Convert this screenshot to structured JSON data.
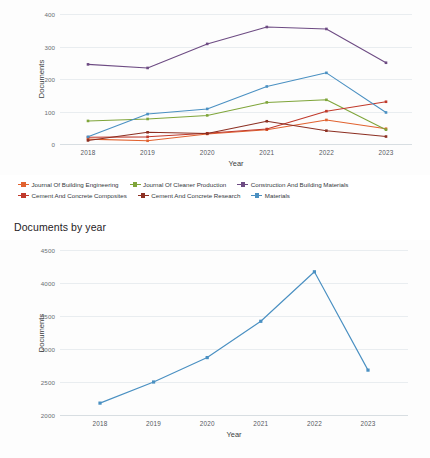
{
  "section": {
    "title": "Documents by year"
  },
  "chart_data": [
    {
      "type": "line",
      "name": "documents-per-source-by-year",
      "title": "",
      "xlabel": "Year",
      "ylabel": "Documents",
      "categories": [
        "2018",
        "2019",
        "2020",
        "2021",
        "2022",
        "2023"
      ],
      "x": [
        2018,
        2019,
        2020,
        2021,
        2022,
        2023
      ],
      "ylim": [
        0,
        400
      ],
      "yticks": [
        0,
        100,
        200,
        300,
        400
      ],
      "grid": true,
      "legend_position": "bottom",
      "series": [
        {
          "name": "Journal Of Building Engineering",
          "color": "#e1622f",
          "values": [
            15,
            10,
            31,
            44,
            74,
            47
          ]
        },
        {
          "name": "Journal Of Cleaner Production",
          "color": "#7fa53a",
          "values": [
            71,
            77,
            88,
            128,
            136,
            44
          ]
        },
        {
          "name": "Construction And Building Materials",
          "color": "#6d4b83",
          "values": [
            245,
            234,
            308,
            360,
            354,
            250
          ]
        },
        {
          "name": "Cement And Concrete Composites",
          "color": "#c0392b",
          "values": [
            21,
            22,
            33,
            46,
            101,
            130
          ]
        },
        {
          "name": "Cement And Concrete Research",
          "color": "#8c2f22",
          "values": [
            11,
            36,
            32,
            70,
            41,
            23
          ]
        },
        {
          "name": "Materials",
          "color": "#4a90c2",
          "values": [
            22,
            92,
            108,
            177,
            219,
            97
          ]
        }
      ]
    },
    {
      "type": "line",
      "name": "documents-by-year",
      "title": "Documents by year",
      "xlabel": "Year",
      "ylabel": "Documents",
      "categories": [
        "2018",
        "2019",
        "2020",
        "2021",
        "2022",
        "2023"
      ],
      "x": [
        2018,
        2019,
        2020,
        2021,
        2022,
        2023
      ],
      "ylim": [
        2000,
        4500
      ],
      "yticks": [
        2000,
        2500,
        3000,
        3500,
        4000,
        4500
      ],
      "grid": true,
      "legend_position": "none",
      "series": [
        {
          "name": "Documents",
          "color": "#4a90c2",
          "values": [
            2180,
            2500,
            2870,
            3420,
            4170,
            2680
          ]
        }
      ]
    }
  ],
  "colors": {
    "background": "#ffffff",
    "grid": "#e9edf0",
    "axis_text": "#6a6f73",
    "title_text": "#1f2326",
    "accent_blue": "#4a90c2",
    "orange": "#e1622f",
    "green": "#7fa53a",
    "purple": "#6d4b83",
    "red": "#c0392b",
    "dark_red": "#8c2f22"
  }
}
